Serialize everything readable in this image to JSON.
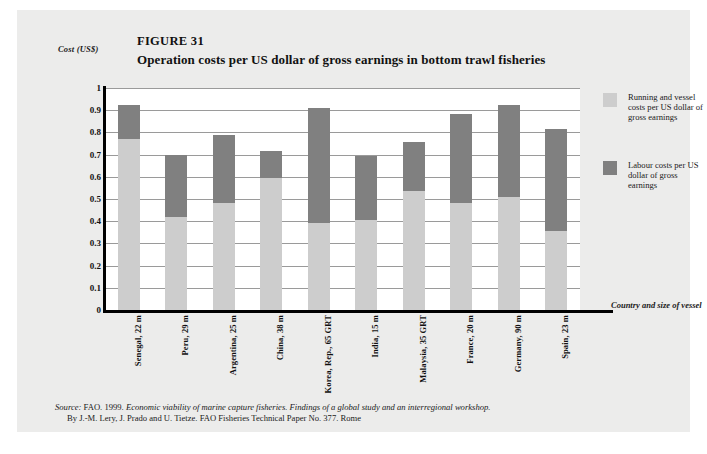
{
  "figure": {
    "number": "FIGURE 31",
    "title": "Operation costs per US dollar of gross earnings in bottom trawl fisheries",
    "y_axis_title": "Cost (US$)",
    "x_axis_title": "Country and size of vessel"
  },
  "legend": {
    "position": "right",
    "entries": [
      {
        "label": "Running and vessel costs per US dollar of gross earnings",
        "color": "#cdcdcd"
      },
      {
        "label": "Labour costs per US dollar of gross earnings",
        "color": "#808080"
      }
    ]
  },
  "source": {
    "line1_prefix": "Source:",
    "line1_a": " FAO. 1999. ",
    "line1_italic": "Economic viability of marine capture fisheries. Findings of a global study and an interregional workshop.",
    "line2": "By J.-M. Lery, J. Prado and U. Tietze. FAO Fisheries Technical Paper No. 377. Rome"
  },
  "chart_data": {
    "type": "bar",
    "stacked": true,
    "title": "Operation costs per US dollar of gross earnings in bottom trawl fisheries",
    "xlabel": "Country and size of vessel",
    "ylabel": "Cost (US$)",
    "ylim": [
      0,
      1
    ],
    "yticks": [
      "0",
      "0.1",
      "0.2",
      "0.3",
      "0.4",
      "0.5",
      "0.6",
      "0.7",
      "0.8",
      "0.9",
      "1"
    ],
    "grid": true,
    "legend_position": "right",
    "categories": [
      "Senegal, 22 m",
      "Peru, 29 m",
      "Argentina, 25 m",
      "China, 38 m",
      "Korea, Rep., 65 GRT",
      "India, 15 m",
      "Malaysia, 35 GRT",
      "France, 20 m",
      "Germany, 90 m",
      "Spain, 23 m"
    ],
    "series": [
      {
        "name": "Running and vessel costs per US dollar of gross earnings",
        "color": "#cdcdcd",
        "values": [
          0.77,
          0.42,
          0.48,
          0.595,
          0.39,
          0.405,
          0.535,
          0.48,
          0.51,
          0.355
        ]
      },
      {
        "name": "Labour costs per US dollar of gross earnings",
        "color": "#808080",
        "values": [
          0.155,
          0.28,
          0.31,
          0.12,
          0.52,
          0.29,
          0.22,
          0.405,
          0.415,
          0.46
        ]
      }
    ],
    "totals": [
      0.925,
      0.7,
      0.79,
      0.715,
      0.91,
      0.695,
      0.755,
      0.885,
      0.925,
      0.815
    ]
  }
}
